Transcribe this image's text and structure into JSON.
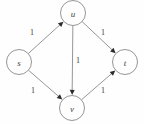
{
  "figure": {
    "kind": "directed-weighted-graph",
    "background_color": "#fefefe",
    "node_stroke_color": "#8a8a8a",
    "edge_stroke_color": "#8a8a8a",
    "arrow_color": "#2b2b2b",
    "label_color": "#3a3a3a",
    "node_radius": 12.5
  },
  "nodes": [
    {
      "id": "s",
      "label": "s",
      "cx": 19,
      "cy": 62
    },
    {
      "id": "u",
      "label": "u",
      "cx": 73,
      "cy": 13
    },
    {
      "id": "v",
      "label": "v",
      "cx": 72,
      "cy": 108
    },
    {
      "id": "t",
      "label": "t",
      "cx": 125,
      "cy": 62
    }
  ],
  "edges": [
    {
      "from": "s",
      "to": "u",
      "weight": "1",
      "label_x": 32,
      "label_y": 32
    },
    {
      "from": "s",
      "to": "v",
      "weight": "1",
      "label_x": 33,
      "label_y": 90
    },
    {
      "from": "u",
      "to": "t",
      "weight": "1",
      "label_x": 103,
      "label_y": 32
    },
    {
      "from": "u",
      "to": "v",
      "weight": "1",
      "label_x": 78,
      "label_y": 60
    },
    {
      "from": "v",
      "to": "t",
      "weight": "1",
      "label_x": 103,
      "label_y": 90
    }
  ]
}
